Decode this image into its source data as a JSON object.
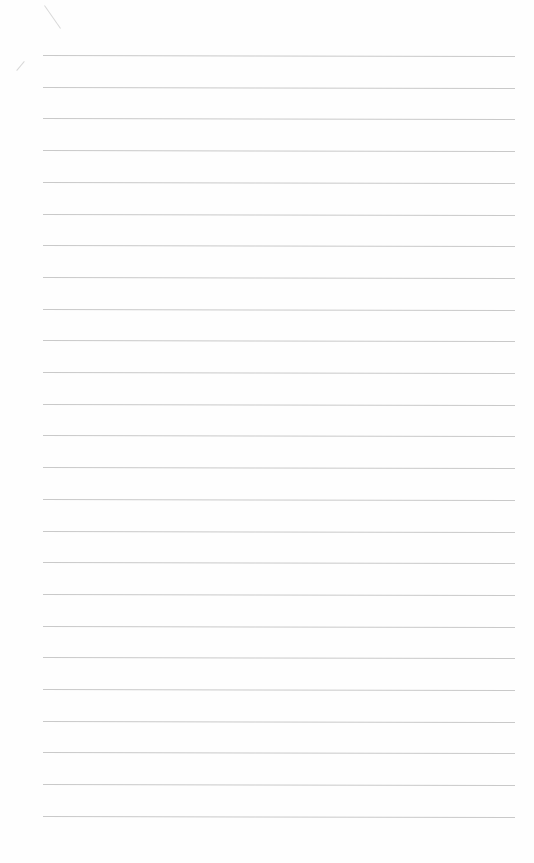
{
  "paper": {
    "type": "lined-notebook-page",
    "line_count": 25,
    "first_line_y": 55,
    "line_spacing": 31.7,
    "line_left": 43,
    "line_right": 515,
    "line_color": "#c9c9c9",
    "background": "#fefefe",
    "text": ""
  }
}
